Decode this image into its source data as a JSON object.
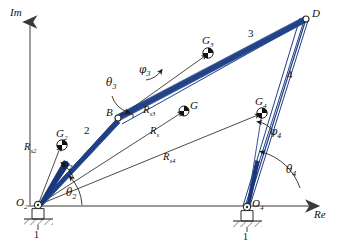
{
  "figure": {
    "kind": "fourbar-linkage-position-vector-diagram",
    "axes": {
      "imaginary_label": "Im",
      "real_label": "Re"
    },
    "ground_label_left": "1",
    "ground_label_right": "1",
    "colors": {
      "link": "#1f3f86",
      "link_fill": "#1a357a",
      "axis": "#8a8a8a",
      "vector": "#2b2b2b",
      "text": "#111111",
      "background": "#ffffff"
    }
  },
  "points": [
    {
      "name": "O2",
      "label": "O",
      "sub": "2",
      "x": 38,
      "y": 205,
      "kind": "pivot"
    },
    {
      "name": "O4",
      "label": "O",
      "sub": "4",
      "x": 247,
      "y": 207,
      "kind": "pivot"
    },
    {
      "name": "B",
      "label": "B",
      "sub": "",
      "x": 118,
      "y": 118,
      "kind": "joint"
    },
    {
      "name": "D",
      "label": "D",
      "sub": "",
      "x": 306,
      "y": 19,
      "kind": "joint"
    },
    {
      "name": "G2",
      "label": "G",
      "sub": "2",
      "x": 62,
      "y": 145,
      "kind": "cg"
    },
    {
      "name": "G3",
      "label": "G",
      "sub": "3",
      "x": 208,
      "y": 53,
      "kind": "cg"
    },
    {
      "name": "G4",
      "label": "G",
      "sub": "4",
      "x": 262,
      "y": 113,
      "kind": "cg"
    },
    {
      "name": "G",
      "label": "G",
      "sub": "",
      "x": 184,
      "y": 111,
      "kind": "cg"
    }
  ],
  "links": [
    {
      "id": "link2",
      "number": "2",
      "from": "O2",
      "to": "B",
      "label_x": 86,
      "label_y": 128
    },
    {
      "id": "link3",
      "number": "3",
      "from": "B",
      "to": "D",
      "label_x": 250,
      "label_y": 35
    },
    {
      "id": "link4",
      "number": "4",
      "from": "D",
      "to": "O4",
      "label_x": 289,
      "label_y": 76
    }
  ],
  "vectors": [
    {
      "id": "Rs2",
      "label": "R",
      "sub": "s2",
      "from": "O2",
      "to": "G2",
      "label_x": 29,
      "label_y": 150
    },
    {
      "id": "Rs3",
      "label": "R",
      "sub": "s3",
      "from": "B",
      "to": "G3",
      "label_x": 146,
      "label_y": 111
    },
    {
      "id": "Rs",
      "label": "R",
      "sub": "s",
      "from": "O2",
      "to": "G",
      "label_x": 152,
      "label_y": 132
    },
    {
      "id": "Rs4",
      "label": "R",
      "sub": "s4",
      "from": "O2",
      "to": "G4",
      "label_x": 166,
      "label_y": 158
    }
  ],
  "angles": [
    {
      "id": "theta2",
      "symbol": "θ",
      "sub": "2",
      "at": "O2",
      "label_x": 68,
      "label_y": 194
    },
    {
      "id": "theta3",
      "symbol": "θ",
      "sub": "3",
      "at": "B",
      "label_x": 112,
      "label_y": 84
    },
    {
      "id": "theta4",
      "symbol": "θ",
      "sub": "4",
      "at": "O4",
      "label_x": 288,
      "label_y": 171
    },
    {
      "id": "phi2",
      "symbol": "φ",
      "sub": "2",
      "at": "O2",
      "label_x": 64,
      "label_y": 166
    },
    {
      "id": "phi3",
      "symbol": "φ",
      "sub": "3",
      "at": "B",
      "label_x": 143,
      "label_y": 72
    },
    {
      "id": "phi4",
      "symbol": "φ",
      "sub": "4",
      "at": "O4",
      "label_x": 272,
      "label_y": 133
    }
  ],
  "axis_labels": {
    "im": {
      "text": "Im",
      "x": 12,
      "y": 14
    },
    "re": {
      "text": "Re",
      "x": 316,
      "y": 212
    }
  },
  "ground_labels": [
    {
      "text": "1",
      "x": 36,
      "y": 231
    },
    {
      "text": "1",
      "x": 245,
      "y": 233
    }
  ]
}
